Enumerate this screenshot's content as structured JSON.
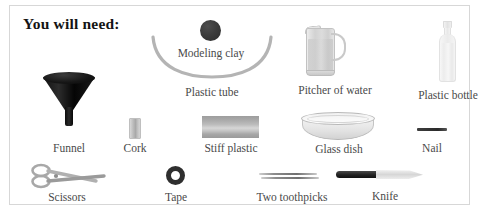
{
  "panel": {
    "title": "You will need:",
    "background_color": "#ffffff",
    "border_color": "#d7d7d7",
    "label_color": "#4a4a4a",
    "title_color": "#141414"
  },
  "items": [
    {
      "id": "modeling-clay",
      "label": "Modeling clay",
      "icon": "clay-ball-icon"
    },
    {
      "id": "plastic-tube",
      "label": "Plastic tube",
      "icon": "u-shaped-tube-icon"
    },
    {
      "id": "pitcher",
      "label": "Pitcher of water",
      "icon": "pitcher-icon"
    },
    {
      "id": "plastic-bottle",
      "label": "Plastic bottle",
      "icon": "bottle-icon"
    },
    {
      "id": "funnel",
      "label": "Funnel",
      "icon": "funnel-icon"
    },
    {
      "id": "cork",
      "label": "Cork",
      "icon": "cork-icon"
    },
    {
      "id": "stiff-plastic",
      "label": "Stiff plastic",
      "icon": "plastic-sheet-icon"
    },
    {
      "id": "glass-dish",
      "label": "Glass dish",
      "icon": "glass-dish-icon"
    },
    {
      "id": "nail",
      "label": "Nail",
      "icon": "nail-icon"
    },
    {
      "id": "scissors",
      "label": "Scissors",
      "icon": "scissors-icon"
    },
    {
      "id": "tape",
      "label": "Tape",
      "icon": "tape-roll-icon"
    },
    {
      "id": "toothpicks",
      "label": "Two toothpicks",
      "icon": "toothpicks-icon"
    },
    {
      "id": "knife",
      "label": "Knife",
      "icon": "knife-icon"
    }
  ]
}
